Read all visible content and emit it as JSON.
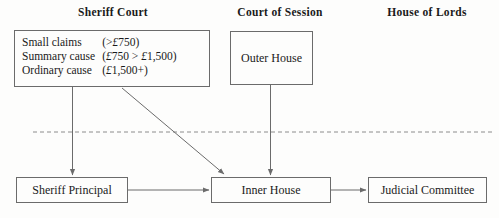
{
  "headers": {
    "sheriff_court": "Sheriff Court",
    "court_of_session": "Court of Session",
    "house_of_lords": "House of Lords"
  },
  "sheriff_court_box": {
    "rows": [
      {
        "type": "Small claims",
        "range_pre": "(>",
        "range_cur1": "£",
        "range_mid": "750)",
        "range_cur2": "",
        "range_post": ""
      },
      {
        "type": "Summary cause",
        "range_pre": "(",
        "range_cur1": "£",
        "range_mid": "750 > ",
        "range_cur2": "£",
        "range_post": "1,500)"
      },
      {
        "type": "Ordinary cause",
        "range_pre": "(",
        "range_cur1": "£",
        "range_mid": "1,500+)",
        "range_cur2": "",
        "range_post": ""
      }
    ]
  },
  "nodes": {
    "outer_house": "Outer House",
    "sheriff_principal": "Sheriff Principal",
    "inner_house": "Inner House",
    "judicial_committee": "Judicial Committee"
  },
  "colors": {
    "line": "#6b6b6b",
    "dashed_divider": "#8c8c8c",
    "text": "#1a1a1a",
    "background": "#fdfdfc"
  }
}
